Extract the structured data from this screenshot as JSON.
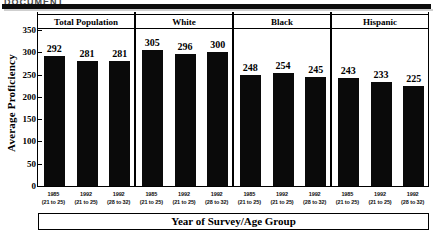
{
  "document": {
    "top_heading_partial": "DOCUMENT",
    "rule_color": "#0d0d0d"
  },
  "chart_data": {
    "type": "bar",
    "title": "",
    "xlabel": "Year of Survey/Age Group",
    "ylabel": "Average Proficiency",
    "ylim": [
      0,
      350
    ],
    "yticks": [
      0,
      50,
      100,
      150,
      200,
      250,
      300,
      350
    ],
    "grid": false,
    "legend": "none",
    "bar_color": "#0a0a0a",
    "panel_layout": "4 side-by-side panels, each with 3 bars",
    "categories": [
      {
        "year": "1985",
        "age": "(21 to 25)"
      },
      {
        "year": "1992",
        "age": "(21 to 25)"
      },
      {
        "year": "1992",
        "age": "(28 to 32)"
      }
    ],
    "panels": [
      {
        "label": "Total Population",
        "values": [
          292,
          281,
          281
        ],
        "bars": [
          {
            "year": "1985",
            "age": "(21 to 25)",
            "value": 292
          },
          {
            "year": "1992",
            "age": "(21 to 25)",
            "value": 281
          },
          {
            "year": "1992",
            "age": "(28 to 32)",
            "value": 281
          }
        ]
      },
      {
        "label": "White",
        "values": [
          305,
          296,
          300
        ],
        "bars": [
          {
            "year": "1985",
            "age": "(21 to 25)",
            "value": 305
          },
          {
            "year": "1992",
            "age": "(21 to 25)",
            "value": 296
          },
          {
            "year": "1992",
            "age": "(28 to 32)",
            "value": 300
          }
        ]
      },
      {
        "label": "Black",
        "values": [
          248,
          254,
          245
        ],
        "bars": [
          {
            "year": "1985",
            "age": "(21 to 25)",
            "value": 248
          },
          {
            "year": "1992",
            "age": "(21 to 25)",
            "value": 254
          },
          {
            "year": "1992",
            "age": "(28 to 32)",
            "value": 245
          }
        ]
      },
      {
        "label": "Hispanic",
        "values": [
          243,
          233,
          225
        ],
        "bars": [
          {
            "year": "1985",
            "age": "(21 to 25)",
            "value": 243
          },
          {
            "year": "1992",
            "age": "(21 to 25)",
            "value": 233
          },
          {
            "year": "1992",
            "age": "(28 to 32)",
            "value": 225
          }
        ]
      }
    ]
  }
}
